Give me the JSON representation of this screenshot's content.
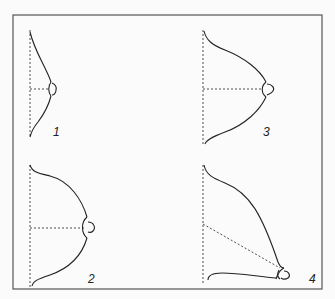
{
  "figure": {
    "panels": [
      {
        "id": 1,
        "label": "1",
        "description": "small conical shape, dashed horizontal axis to nipple"
      },
      {
        "id": 2,
        "label": "2",
        "description": "large hemispherical shape, dashed horizontal axis to nipple"
      },
      {
        "id": 3,
        "label": "3",
        "description": "medium conical shape, dashed horizontal axis to nipple"
      },
      {
        "id": 4,
        "label": "4",
        "description": "ptotic shape, dashed diagonal axis downward to nipple"
      }
    ],
    "colors": {
      "line": "#222222",
      "frame": "#555555",
      "background": "#fbfbfb"
    }
  }
}
